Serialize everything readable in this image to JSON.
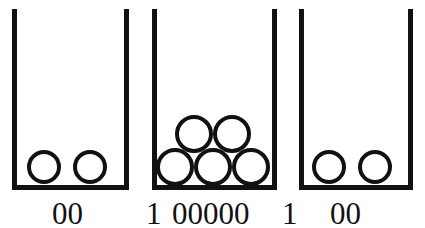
{
  "figure": {
    "background_color": "#ffffff",
    "stroke_color": "#111111",
    "width": 425,
    "height": 228
  },
  "bins": [
    {
      "id": "bin-1",
      "ball_count": 2,
      "caption": "00",
      "x": 12,
      "y": 9,
      "width": 117,
      "height": 181,
      "balls": [
        {
          "cx": 44,
          "cy": 167,
          "r": 17
        },
        {
          "cx": 90,
          "cy": 167,
          "r": 17
        }
      ]
    },
    {
      "id": "bin-2",
      "ball_count": 5,
      "caption": "00000",
      "x": 152,
      "y": 9,
      "width": 125,
      "height": 181,
      "balls": [
        {
          "cx": 175,
          "cy": 167,
          "r": 19
        },
        {
          "cx": 213,
          "cy": 167,
          "r": 19
        },
        {
          "cx": 251,
          "cy": 167,
          "r": 19
        },
        {
          "cx": 194,
          "cy": 134,
          "r": 19
        },
        {
          "cx": 232,
          "cy": 134,
          "r": 19
        }
      ]
    },
    {
      "id": "bin-3",
      "ball_count": 2,
      "caption": "00",
      "x": 299,
      "y": 9,
      "width": 114,
      "height": 181,
      "balls": [
        {
          "cx": 329,
          "cy": 167,
          "r": 17
        },
        {
          "cx": 375,
          "cy": 167,
          "r": 17
        }
      ]
    }
  ],
  "separators": [
    {
      "id": "separator-1",
      "label": "1",
      "x": 146,
      "y": 198
    },
    {
      "id": "separator-2",
      "label": "1",
      "x": 282,
      "y": 198
    }
  ],
  "captions": [
    {
      "id": "caption-bin-1",
      "label": "00",
      "x": 52,
      "y": 198
    },
    {
      "id": "caption-bin-2",
      "label": "00000",
      "x": 172,
      "y": 198
    },
    {
      "id": "caption-bin-3",
      "label": "00",
      "x": 330,
      "y": 198
    }
  ],
  "encoding": {
    "full_string": "00 1 00000 1 00",
    "notation": "unary-with-separators"
  }
}
